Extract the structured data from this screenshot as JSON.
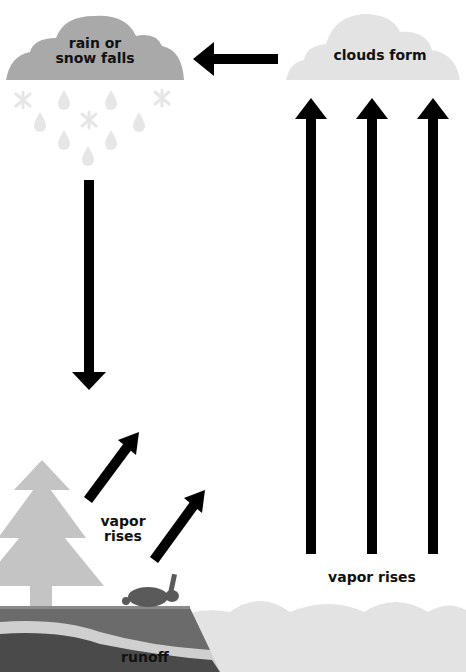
{
  "diagram": {
    "colors": {
      "cloud_rain": "#a9a9a9",
      "cloud_form": "#e3e3e3",
      "precip": "#e6e6e6",
      "tree": "#c4c4c4",
      "ground_top": "#6b6b6b",
      "ground_body": "#4a4a4a",
      "runoff_stream": "#cfcfcf",
      "water": "#e3e3e3",
      "arrow": "#000000",
      "rabbit": "#5a5a5a"
    },
    "labels": {
      "rain_cloud_line1": "rain or",
      "rain_cloud_line2": "snow falls",
      "clouds_form": "clouds form",
      "land_vapor_line1": "vapor",
      "land_vapor_line2": "rises",
      "ocean_vapor": "vapor rises",
      "runoff": "runoff"
    },
    "arrows": [
      {
        "id": "clouds-to-rain",
        "direction": "left"
      },
      {
        "id": "precipitation-down",
        "direction": "down"
      },
      {
        "id": "land-evaporation-1",
        "direction": "up-right"
      },
      {
        "id": "land-evaporation-2",
        "direction": "up-right"
      },
      {
        "id": "ocean-evaporation-1",
        "direction": "up"
      },
      {
        "id": "ocean-evaporation-2",
        "direction": "up"
      },
      {
        "id": "ocean-evaporation-3",
        "direction": "up"
      }
    ]
  }
}
